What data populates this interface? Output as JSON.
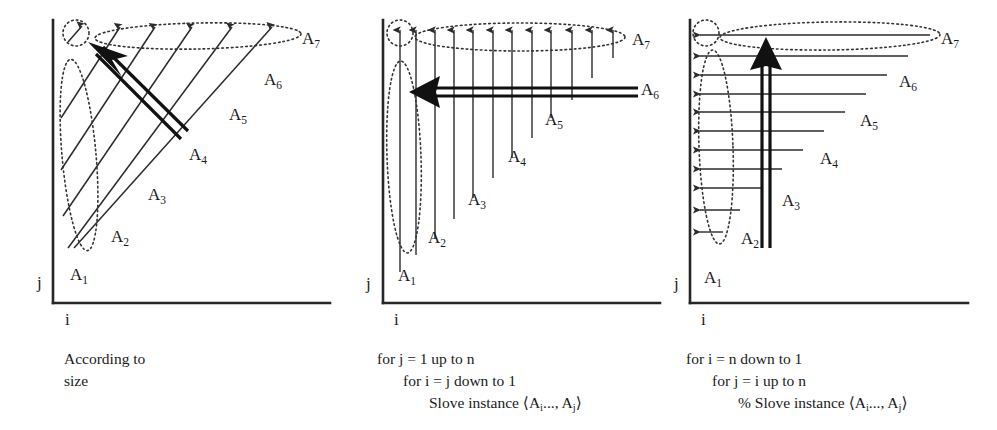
{
  "figure": {
    "background_color": "#ffffff",
    "ink_color": "#1a1a1a"
  },
  "panels": [
    {
      "id": "panel-diagonal",
      "axis": {
        "x_label": "i",
        "y_label": "j"
      },
      "group_labels": [
        "A",
        "A",
        "A",
        "A",
        "A",
        "A",
        "A"
      ],
      "group_subscripts": [
        "1",
        "2",
        "3",
        "4",
        "5",
        "6",
        "7"
      ],
      "caption_lines": [
        "According to",
        "size"
      ],
      "sweep_direction": "diagonal-up-left",
      "wave_count": 7
    },
    {
      "id": "panel-columns",
      "axis": {
        "x_label": "i",
        "y_label": "j"
      },
      "group_labels": [
        "A",
        "A",
        "A",
        "A",
        "A",
        "A",
        "A"
      ],
      "group_subscripts": [
        "1",
        "2",
        "3",
        "4",
        "5",
        "6",
        "7"
      ],
      "caption_lines": [
        "for j = 1 up to n",
        "for i = j down to 1",
        "Slove instance ⟨Aᵢ..., Aⱼ⟩"
      ],
      "caption_plain": [
        "for j = 1 up to n",
        "for i = j down to 1",
        "Slove instance <Ai..., Aj>"
      ],
      "sweep_direction": "right-to-left",
      "wave_count": 10
    },
    {
      "id": "panel-rows",
      "axis": {
        "x_label": "i",
        "y_label": "j"
      },
      "group_labels": [
        "A",
        "A",
        "A",
        "A",
        "A",
        "A",
        "A"
      ],
      "group_subscripts": [
        "1",
        "2",
        "3",
        "4",
        "5",
        "6",
        "7"
      ],
      "caption_lines": [
        "for i = n down to 1",
        "for j = i up to n",
        "% Slove instance ⟨Aᵢ..., Aⱼ⟩"
      ],
      "caption_plain": [
        "for i = n down to 1",
        "for j = i up to n",
        "% Slove instance <Ai..., Aj>"
      ],
      "sweep_direction": "bottom-to-top",
      "wave_count": 10
    }
  ],
  "labels": {
    "p1": {
      "a1_base": "A",
      "a1_sub": "1",
      "a2_base": "A",
      "a2_sub": "2",
      "a3_base": "A",
      "a3_sub": "3",
      "a4_base": "A",
      "a4_sub": "4",
      "a5_base": "A",
      "a5_sub": "5",
      "a6_base": "A",
      "a6_sub": "6",
      "a7_base": "A",
      "a7_sub": "7",
      "axis_i": "i",
      "axis_j": "j"
    },
    "p2": {
      "a1_base": "A",
      "a1_sub": "1",
      "a2_base": "A",
      "a2_sub": "2",
      "a3_base": "A",
      "a3_sub": "3",
      "a4_base": "A",
      "a4_sub": "4",
      "a5_base": "A",
      "a5_sub": "5",
      "a6_base": "A",
      "a6_sub": "6",
      "a7_base": "A",
      "a7_sub": "7",
      "axis_i": "i",
      "axis_j": "j"
    },
    "p3": {
      "a1_base": "A",
      "a1_sub": "1",
      "a2_base": "A",
      "a2_sub": "2",
      "a3_base": "A",
      "a3_sub": "3",
      "a4_base": "A",
      "a4_sub": "4",
      "a5_base": "A",
      "a5_sub": "5",
      "a6_base": "A",
      "a6_sub": "6",
      "a7_base": "A",
      "a7_sub": "7",
      "axis_i": "i",
      "axis_j": "j"
    }
  },
  "captions": {
    "p1_line1": "According to",
    "p1_line2": "size",
    "p2_line1": "for j = 1 up to n",
    "p2_line2": "for i = j down to 1",
    "p2_line3_pre": "Slove instance ⟨A",
    "p2_line3_sub1": "i",
    "p2_line3_mid": "..., A",
    "p2_line3_sub2": "j",
    "p2_line3_post": "⟩",
    "p3_line1": "for i = n down to 1",
    "p3_line2": "for j = i up to n",
    "p3_line3_pre": "% Slove instance ⟨A",
    "p3_line3_sub1": "i",
    "p3_line3_mid": "..., A",
    "p3_line3_sub2": "j",
    "p3_line3_post": "⟩"
  }
}
